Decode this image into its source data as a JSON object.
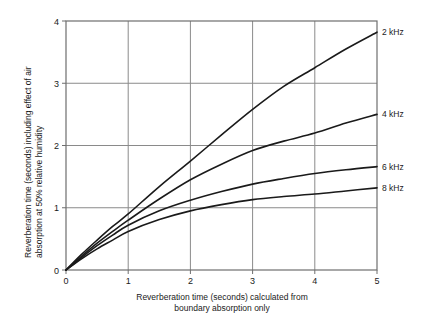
{
  "chart_data": {
    "type": "line",
    "title": "",
    "xlabel": "Reverberation time (seconds) calculated from boundary absorption only",
    "xlabel_line1": "Reverberation time (seconds) calculated from",
    "xlabel_line2": "boundary absorption only",
    "ylabel": "Reverberation time (seconds) including effect of air absorption at 50% relative humidity",
    "ylabel_line1": "Reverberation time (seconds) including effect of air",
    "ylabel_line2": "absorption at 50% relative humidity",
    "xlim": [
      0,
      5
    ],
    "ylim": [
      0,
      4
    ],
    "xticks": [
      "0",
      "1",
      "2",
      "3",
      "4",
      "5"
    ],
    "yticks": [
      "0",
      "1",
      "2",
      "3",
      "4"
    ],
    "grid": true,
    "legend_position": "right-inline",
    "line_color": "#1a1a1a",
    "grid_color": "#8a8a8a",
    "axis_color": "#6e6e6e",
    "x": [
      0,
      0.25,
      0.5,
      0.75,
      1,
      1.5,
      2,
      2.5,
      3,
      3.5,
      4,
      4.5,
      5
    ],
    "series": [
      {
        "name": "2 kHz",
        "label": "2 kHz",
        "values": [
          0,
          0.25,
          0.48,
          0.7,
          0.9,
          1.34,
          1.75,
          2.17,
          2.58,
          2.95,
          3.25,
          3.55,
          3.82
        ]
      },
      {
        "name": "4 kHz",
        "label": "4 kHz",
        "values": [
          0,
          0.22,
          0.43,
          0.62,
          0.8,
          1.14,
          1.45,
          1.7,
          1.92,
          2.07,
          2.2,
          2.36,
          2.5
        ]
      },
      {
        "name": "6 kHz",
        "label": "6 kHz",
        "values": [
          0,
          0.2,
          0.39,
          0.56,
          0.72,
          0.95,
          1.12,
          1.26,
          1.38,
          1.47,
          1.55,
          1.61,
          1.66
        ]
      },
      {
        "name": "8 kHz",
        "label": "8 kHz",
        "values": [
          0,
          0.18,
          0.34,
          0.48,
          0.62,
          0.81,
          0.95,
          1.05,
          1.13,
          1.18,
          1.22,
          1.27,
          1.32
        ]
      }
    ]
  }
}
